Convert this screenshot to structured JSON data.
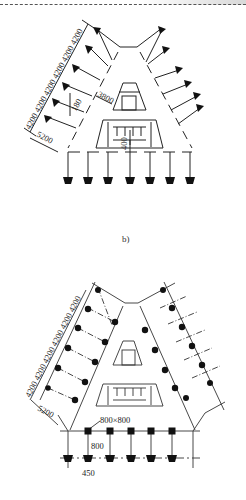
{
  "figure": {
    "header_rule": "dashed",
    "diagram_a": {
      "caption": "b)",
      "left_dimensions": "4200 4200 4200 4200 4200 4200",
      "dim_spacing": "4200",
      "dim_edge": "5200",
      "dim_3800": "3800",
      "dim_180": "180",
      "dim_400": "400"
    },
    "diagram_b": {
      "left_dimensions": "4200 4200 4200 4200 4200 4200",
      "dim_edge": "5200",
      "pile_size": "800×800",
      "dim_800": "800",
      "dim_450": "450"
    }
  },
  "colors": {
    "line": "#222222",
    "fill": "#111111",
    "paper": "#ffffff"
  }
}
